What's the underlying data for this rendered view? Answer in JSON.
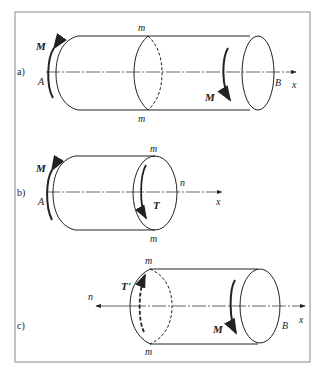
{
  "figure": {
    "panels": [
      {
        "id": "a",
        "label": "a)",
        "labels": {
          "M_left": "M",
          "A": "A",
          "m_top": "m",
          "m_bottom": "m",
          "M_right": "M",
          "B": "B",
          "x": "x"
        }
      },
      {
        "id": "b",
        "label": "b)",
        "labels": {
          "M_left": "M",
          "A": "A",
          "m_top": "m",
          "m_bottom": "m",
          "n": "n",
          "T": "T",
          "x": "x"
        }
      },
      {
        "id": "c",
        "label": "c)",
        "labels": {
          "n": "n",
          "m_top": "m",
          "m_bottom": "m",
          "T_prime": "T'",
          "M": "M",
          "B": "B",
          "x": "x"
        }
      }
    ],
    "colors": {
      "line": "#222222",
      "frame": "#888888",
      "background": "#ffffff"
    }
  }
}
